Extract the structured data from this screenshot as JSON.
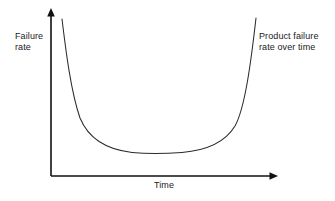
{
  "chart_data": {
    "type": "line",
    "title": "",
    "subtitle": "",
    "xlabel": "Time",
    "ylabel": "Failure\nrate",
    "annotation": "Product failure\nrate over time",
    "legend": [],
    "legend_position": "none",
    "grid": false,
    "xlim": [
      0,
      1
    ],
    "ylim": [
      0,
      1
    ],
    "xticks": [],
    "yticks": [],
    "xtick_labels": [],
    "ytick_labels": [],
    "axis_style": {
      "x_axis_arrow": true,
      "y_axis_arrow": true,
      "spines": [
        "left",
        "bottom"
      ]
    },
    "series": [
      {
        "name": "Failure rate",
        "description": "Bathtub curve: high early-life infant mortality failures, a long flat constant-failure-rate useful-life period, then sharply rising wear-out failures.",
        "x": [
          0.05,
          0.07,
          0.09,
          0.12,
          0.15,
          0.19,
          0.24,
          0.3,
          0.38,
          0.46,
          0.55,
          0.64,
          0.72,
          0.79,
          0.85,
          0.89,
          0.92,
          0.94,
          0.96,
          0.97
        ],
        "y": [
          0.95,
          0.78,
          0.62,
          0.45,
          0.33,
          0.24,
          0.18,
          0.14,
          0.12,
          0.11,
          0.11,
          0.13,
          0.17,
          0.24,
          0.36,
          0.5,
          0.65,
          0.78,
          0.89,
          0.96
        ]
      }
    ],
    "phases": [
      {
        "name": "infant-mortality",
        "trend": "decreasing"
      },
      {
        "name": "useful-life",
        "trend": "constant"
      },
      {
        "name": "wear-out",
        "trend": "increasing"
      }
    ],
    "colors": {
      "background": "#ffffff",
      "axis": "#111111",
      "curve": "#2b2b2b",
      "text": "#1a1a1a"
    }
  },
  "geometry": {
    "axis": {
      "origin_x": 51,
      "origin_y": 176,
      "y_top": 10,
      "x_right": 277
    },
    "curve_path": "M 62,19 C 66,52 71,92 80,118 C 90,142 110,150 132,152.4 C 145,153.6 165,153.6 182,152.4 C 205,150.6 224,144 235,126 C 245,108 251,62 256,18"
  },
  "labels": {
    "y_axis": "Failure\nrate",
    "x_axis": "Time",
    "annotation": "Product failure\nrate over time"
  }
}
